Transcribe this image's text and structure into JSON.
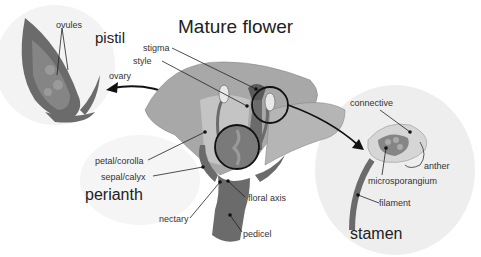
{
  "title": "Mature flower",
  "groups": {
    "pistil": "pistil",
    "perianth": "perianth",
    "stamen": "stamen"
  },
  "labels": {
    "ovules": "ovules",
    "ovary": "ovary",
    "stigma": "stigma",
    "style": "style",
    "petal_corolla": "petal/corolla",
    "sepal_calyx": "sepal/calyx",
    "nectary": "nectary",
    "floral_axis": "floral axis",
    "pedicel": "pedicel",
    "connective": "connective",
    "anther": "anther",
    "microsporangium": "microsporangium",
    "filament": "filament"
  },
  "colors": {
    "dark_tissue": "#6b6b6b",
    "petal": "#a8a8a8",
    "petal_light": "#c4c4c4",
    "ovary_fill": "#7a7a7a",
    "bg_blob": "#f2f2f2",
    "line": "#222222"
  }
}
